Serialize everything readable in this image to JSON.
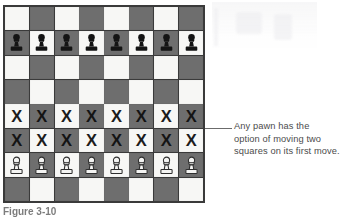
{
  "figure": {
    "kind": "chess-diagram",
    "caption": "Figure 3-10",
    "colors": {
      "light_square": "#f7f7f5",
      "dark_square": "#6e6e6e",
      "border": "#3a3a3a",
      "text": "#4c4c4c",
      "mark": "#1c1c1c",
      "leader_line": "#6b6b6b"
    }
  },
  "annotation": {
    "leader_icon": "leader-line",
    "lines": [
      "Any pawn has the",
      "option of moving two",
      "squares on its first move."
    ],
    "full_text": "Any pawn has the option of moving two squares on its first move."
  },
  "board": {
    "files": [
      "a",
      "b",
      "c",
      "d",
      "e",
      "f",
      "g",
      "h"
    ],
    "ranks": [
      8,
      7,
      6,
      5,
      4,
      3,
      2,
      1
    ],
    "squares_per_side": 8,
    "mark_label": "X",
    "rows": [
      {
        "rank": 8,
        "first_square_color": "light",
        "cells": [
          "",
          "",
          "",
          "",
          "",
          "",
          "",
          ""
        ]
      },
      {
        "rank": 7,
        "first_square_color": "dark",
        "cells": [
          "black-pawn",
          "black-pawn",
          "black-pawn",
          "black-pawn",
          "black-pawn",
          "black-pawn",
          "black-pawn",
          "black-pawn"
        ]
      },
      {
        "rank": 6,
        "first_square_color": "light",
        "cells": [
          "",
          "",
          "",
          "",
          "",
          "",
          "",
          ""
        ]
      },
      {
        "rank": 5,
        "first_square_color": "dark",
        "cells": [
          "",
          "",
          "",
          "",
          "",
          "",
          "",
          ""
        ]
      },
      {
        "rank": 4,
        "first_square_color": "light",
        "cells": [
          "mark-x",
          "mark-x",
          "mark-x",
          "mark-x",
          "mark-x",
          "mark-x",
          "mark-x",
          "mark-x"
        ]
      },
      {
        "rank": 3,
        "first_square_color": "dark",
        "cells": [
          "mark-x",
          "mark-x",
          "mark-x",
          "mark-x",
          "mark-x",
          "mark-x",
          "mark-x",
          "mark-x"
        ]
      },
      {
        "rank": 2,
        "first_square_color": "light",
        "cells": [
          "white-pawn",
          "white-pawn",
          "white-pawn",
          "white-pawn",
          "white-pawn",
          "white-pawn",
          "white-pawn",
          "white-pawn"
        ]
      },
      {
        "rank": 1,
        "first_square_color": "dark",
        "cells": [
          "",
          "",
          "",
          "",
          "",
          "",
          "",
          ""
        ]
      }
    ]
  }
}
